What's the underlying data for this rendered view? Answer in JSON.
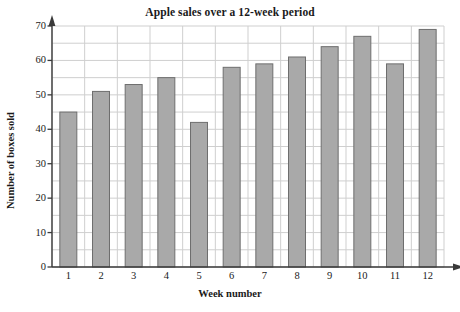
{
  "chart_data": {
    "type": "bar",
    "title": "Apple sales over a 12-week period",
    "xlabel": "Week number",
    "ylabel": "Number of boxes sold",
    "categories": [
      "1",
      "2",
      "3",
      "4",
      "5",
      "6",
      "7",
      "8",
      "9",
      "10",
      "11",
      "12"
    ],
    "values": [
      45,
      51,
      53,
      55,
      42,
      58,
      59,
      61,
      64,
      67,
      59,
      69
    ],
    "ylim": [
      0,
      70
    ],
    "ytick_labels": [
      "0",
      "10",
      "20",
      "30",
      "40",
      "50",
      "60",
      "70"
    ],
    "ytick_values": [
      0,
      10,
      20,
      30,
      40,
      50,
      60,
      70
    ],
    "ytick_step": 10,
    "grid": true,
    "grid_minor_step": 5,
    "legend": null,
    "bar_fill": "#a9a9a9",
    "bar_stroke": "#6e6e6e",
    "grid_color": "#cfcfcf",
    "axis_color": "#3a3a3a",
    "background": "#ffffff"
  }
}
